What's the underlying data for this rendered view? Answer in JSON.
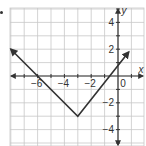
{
  "chart_data": {
    "type": "line",
    "title": "",
    "xlabel": "x",
    "ylabel": "y",
    "xlim": [
      -7,
      1
    ],
    "ylim": [
      -5,
      5
    ],
    "grid": true,
    "x_tick_labels": [
      "-6",
      "-4",
      "-2",
      "0"
    ],
    "y_tick_labels": [
      "4",
      "2",
      "-2",
      "-4"
    ],
    "series": [
      {
        "name": "absolute value function",
        "x": [
          -8,
          -3,
          0.8
        ],
        "y": [
          2,
          -3,
          1.8
        ],
        "vertex": [
          -3,
          -3
        ],
        "x_intercepts": [
          -6,
          0
        ],
        "arrows": "both ends"
      }
    ],
    "colors": {
      "grid": "#c8c8c8",
      "axis": "#333333",
      "line": "#333333"
    }
  }
}
